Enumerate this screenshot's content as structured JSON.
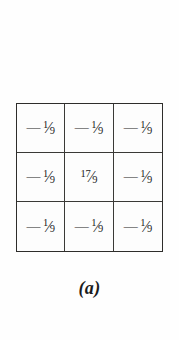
{
  "figure": {
    "caption": "(a)"
  },
  "kernel": {
    "rows": [
      [
        {
          "sign": "—",
          "numerator": "1",
          "slash": "⁄",
          "denominator": "9",
          "text": "—1/9"
        },
        {
          "sign": "—",
          "numerator": "1",
          "slash": "⁄",
          "denominator": "9",
          "text": "—1/9"
        },
        {
          "sign": "—",
          "numerator": "1",
          "slash": "⁄",
          "denominator": "9",
          "text": "—1/9"
        }
      ],
      [
        {
          "sign": "—",
          "numerator": "1",
          "slash": "⁄",
          "denominator": "9",
          "text": "—1/9"
        },
        {
          "sign": "",
          "numerator": "17",
          "slash": "⁄",
          "denominator": "9",
          "text": "17/9"
        },
        {
          "sign": "—",
          "numerator": "1",
          "slash": "⁄",
          "denominator": "9",
          "text": "—1/9"
        }
      ],
      [
        {
          "sign": "—",
          "numerator": "1",
          "slash": "⁄",
          "denominator": "9",
          "text": "—1/9"
        },
        {
          "sign": "—",
          "numerator": "1",
          "slash": "⁄",
          "denominator": "9",
          "text": "—1/9"
        },
        {
          "sign": "—",
          "numerator": "1",
          "slash": "⁄",
          "denominator": "9",
          "text": "—1/9"
        }
      ]
    ]
  },
  "chart_data": {
    "type": "heatmap",
    "title": "(a)",
    "xlabel": "",
    "ylabel": "",
    "categories": [
      "col-1",
      "col-2",
      "col-3"
    ],
    "row_labels": [
      "row-1",
      "row-2",
      "row-3"
    ],
    "values": [
      [
        -0.1111,
        -0.1111,
        -0.1111
      ],
      [
        -0.1111,
        1.8889,
        -0.1111
      ],
      [
        -0.1111,
        -0.1111,
        -0.1111
      ]
    ],
    "cell_labels": [
      [
        "—1/9",
        "—1/9",
        "—1/9"
      ],
      [
        "—1/9",
        "17/9",
        "—1/9"
      ],
      [
        "—1/9",
        "—1/9",
        "—1/9"
      ]
    ],
    "grid": true,
    "legend": "none"
  },
  "colors": {
    "background": "#fefefe",
    "cell_fill": "#fdfdfd",
    "outer_border": "#2e2d2b",
    "inner_border": "#3a3936",
    "text": "#1b1b1b"
  }
}
